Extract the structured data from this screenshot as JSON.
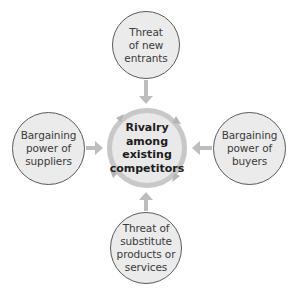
{
  "diagram": {
    "type": "porters-five-forces",
    "center": {
      "label": "Rivalry among existing competitors",
      "lines": [
        "Rivalry",
        "among",
        "existing",
        "competitors"
      ]
    },
    "forces": {
      "top": {
        "label": "Threat of new entrants",
        "lines": [
          "Threat",
          "of new",
          "entrants"
        ]
      },
      "left": {
        "label": "Bargaining power of suppliers",
        "lines": [
          "Bargaining",
          "power of",
          "suppliers"
        ]
      },
      "right": {
        "label": "Bargaining power of buyers",
        "lines": [
          "Bargaining",
          "power of",
          "buyers"
        ]
      },
      "bottom": {
        "label": "Threat of substitute products or services",
        "lines": [
          "Threat of",
          "substitute",
          "products or",
          "services"
        ]
      }
    },
    "colors": {
      "circle_fill": "#ebebeb",
      "circle_border": "#5a5a5a",
      "arrow": "#bdbdbd",
      "center_ring": "#c8c8c8",
      "text": "#3a3a3a",
      "center_text": "#1c1c1c"
    },
    "arrows": [
      {
        "from": "top",
        "to": "center"
      },
      {
        "from": "left",
        "to": "center"
      },
      {
        "from": "right",
        "to": "center"
      },
      {
        "from": "bottom",
        "to": "center"
      }
    ]
  }
}
